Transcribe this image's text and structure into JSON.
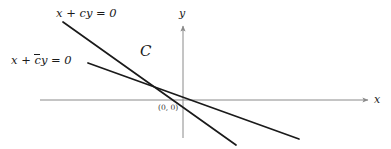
{
  "figure": {
    "background_color": "#ffffff",
    "axis_color": "#8a8a8a",
    "line_color": "#1a1a1a",
    "text_color": "#1a1a1a",
    "width": 391,
    "height": 149
  },
  "axes": {
    "x_label": "x",
    "y_label": "y",
    "origin_label": "(0, 0)",
    "x_axis": {
      "x1": 40,
      "y1": 100,
      "x2": 372,
      "y2": 100
    },
    "y_axis": {
      "x1": 183,
      "y1": 138,
      "x2": 183,
      "y2": 22
    }
  },
  "lines": [
    {
      "name": "line-c",
      "label_prefix": "x + ",
      "label_symbol": "c",
      "label_suffix": "y = 0",
      "label_text": "x + cy = 0",
      "overline": false,
      "x1": 63,
      "y1": 22,
      "x2": 236,
      "y2": 145
    },
    {
      "name": "line-cbar",
      "label_prefix": "x + ",
      "label_symbol": "c",
      "label_suffix": "y = 0",
      "label_text": "x + c̄y = 0",
      "overline": true,
      "x1": 88,
      "y1": 63,
      "x2": 299,
      "y2": 139
    }
  ],
  "curve": {
    "label": "C",
    "description": "script C labelling the curve between the two lines"
  },
  "chart_data": {
    "type": "line",
    "xlabel": "x",
    "ylabel": "y",
    "grid": false,
    "legend": "none",
    "origin": [
      0,
      0
    ],
    "series": [
      {
        "name": "x + cy = 0",
        "slope_sign": "negative",
        "steepness": "steep"
      },
      {
        "name": "x + c̄y = 0",
        "slope_sign": "negative",
        "steepness": "shallow"
      }
    ],
    "annotations": [
      "C",
      "(0, 0)"
    ]
  }
}
